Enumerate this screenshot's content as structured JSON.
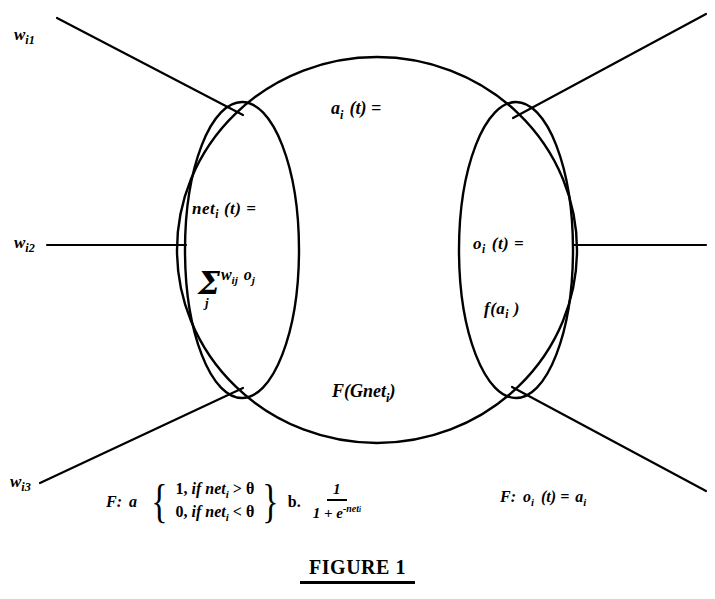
{
  "figure": {
    "caption": "FIGURE 1",
    "caption_underlined": true
  },
  "colors": {
    "stroke": "#000000",
    "background": "#ffffff"
  },
  "inputs": [
    {
      "name": "w-i1",
      "base": "w",
      "subscript": "i1"
    },
    {
      "name": "w-i2",
      "base": "w",
      "subscript": "i2"
    },
    {
      "name": "w-i3",
      "base": "w",
      "subscript": "i3"
    }
  ],
  "cell": {
    "net_label": {
      "base": "net",
      "subscript": "i",
      "suffix": "(t)  ="
    },
    "sum": {
      "sigma": "Σ",
      "index": "j",
      "terms_base": "w",
      "terms_sub1": "ij",
      "terms_base2": "o",
      "terms_sub2": "j"
    },
    "activation_label": {
      "base": "a",
      "subscript": "i",
      "suffix": "(t)  ="
    },
    "activation_value": {
      "text": "F(Gnet",
      "subscript": "i",
      "suffix": ")"
    },
    "output_label": {
      "base": "o",
      "subscript": "i",
      "suffix": "(t)  ="
    },
    "output_value": {
      "prefix": "f(a",
      "subscript": "i",
      "suffix": " )"
    }
  },
  "formulas": {
    "left": {
      "prefix": "F:",
      "case_tag": "a",
      "case_1": {
        "value": "1,",
        "cond": "if net",
        "sub": "i",
        "op": ">",
        "theta": "θ"
      },
      "case_2": {
        "value": "0,",
        "cond": "if net",
        "sub": "i",
        "op": "<",
        "theta": "θ"
      },
      "alt_tag": "b.",
      "fraction": {
        "numerator": "1",
        "denominator_prefix": "1 + e",
        "exponent": "-net",
        "exponent_sub": "i"
      }
    },
    "right": {
      "prefix": "F:",
      "base": "o",
      "subscript": "i",
      "middle": "(t) =",
      "result_base": "a",
      "result_sub": "i"
    }
  },
  "geometry": {
    "outer_ellipse": {
      "cx": 377,
      "cy": 250,
      "rx": 200,
      "ry": 193
    },
    "left_ellipse": {
      "cx": 242,
      "cy": 250,
      "rx": 57,
      "ry": 148
    },
    "right_ellipse": {
      "cx": 516,
      "cy": 250,
      "rx": 57,
      "ry": 148
    },
    "connections": [
      {
        "name": "input-line-top",
        "x1": 57,
        "y1": 18,
        "x2": 243,
        "y2": 115
      },
      {
        "name": "input-line-middle",
        "x1": 47,
        "y1": 245,
        "x2": 186,
        "y2": 245
      },
      {
        "name": "input-line-bottom",
        "x1": 40,
        "y1": 483,
        "x2": 243,
        "y2": 388
      },
      {
        "name": "output-line-top",
        "x1": 513,
        "y1": 118,
        "x2": 706,
        "y2": 14
      },
      {
        "name": "output-line-middle",
        "x1": 573,
        "y1": 245,
        "x2": 706,
        "y2": 245
      },
      {
        "name": "output-line-bottom",
        "x1": 512,
        "y1": 387,
        "x2": 706,
        "y2": 491
      }
    ]
  }
}
